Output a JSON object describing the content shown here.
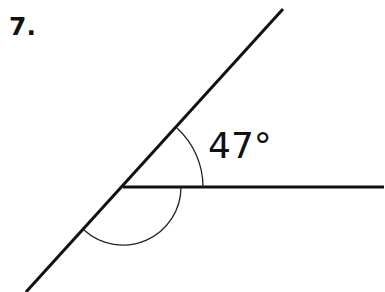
{
  "problem": {
    "number": "7.",
    "angle_label": "47°"
  },
  "diagram": {
    "vertex": [
      123,
      187
    ],
    "ray_horizontal_end": [
      384,
      187
    ],
    "line_diagonal": {
      "start": [
        283,
        9
      ],
      "end": [
        26,
        292
      ]
    },
    "arc_known": {
      "radius": 80,
      "label": "47°"
    },
    "arc_unknown": {
      "radius": 58
    }
  }
}
